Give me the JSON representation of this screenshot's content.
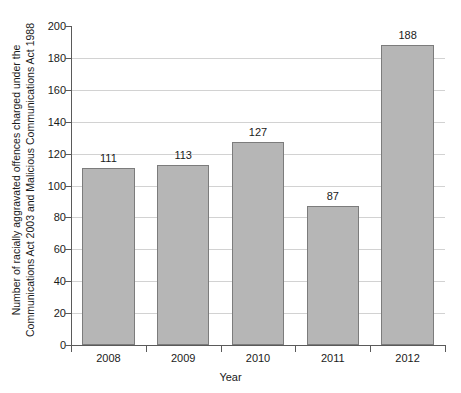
{
  "chart_data": {
    "type": "bar",
    "title": "",
    "subtitle": "",
    "categories": [
      "2008",
      "2009",
      "2010",
      "2011",
      "2012"
    ],
    "values": [
      111,
      113,
      127,
      87,
      188
    ],
    "data_labels": [
      "111",
      "113",
      "127",
      "87",
      "188"
    ],
    "xlabel": "Year",
    "ylabel_line1": "Number of racially aggravated offences charged under the",
    "ylabel_line2": "Communications Act 2003 and Malicious Communications Act 1988",
    "ylim": [
      0,
      200
    ],
    "ytick_values": [
      0,
      20,
      40,
      60,
      80,
      100,
      120,
      140,
      160,
      180,
      200
    ],
    "ytick_labels": [
      "0",
      "20",
      "40",
      "60",
      "80",
      "100",
      "120",
      "140",
      "160",
      "180",
      "200"
    ],
    "grid": true,
    "legend": "none",
    "bar_fill_color": "#b6b6b6",
    "bar_edge_color": "#7c7c7c",
    "gridline_color": "#d2d2d2",
    "axis_color": "#5a5a5a",
    "background_color": "#ffffff"
  }
}
